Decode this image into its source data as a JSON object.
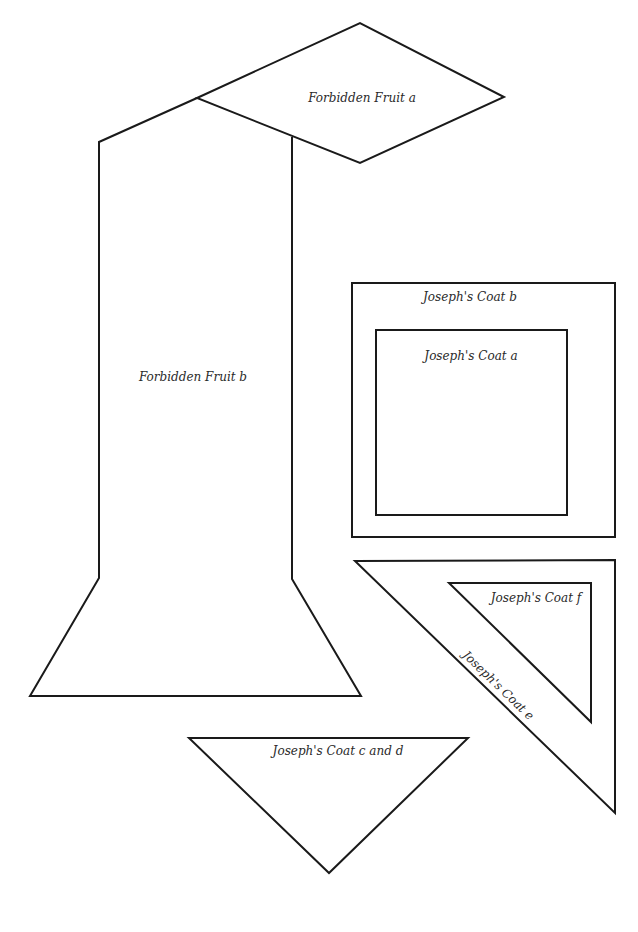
{
  "colors": {
    "line": "#1a1a1a",
    "text": "#2a2a2a",
    "background": "#ffffff"
  },
  "pieces": [
    {
      "id": "forbidden-fruit-a",
      "label": "Forbidden Fruit a",
      "shape": "diamond"
    },
    {
      "id": "forbidden-fruit-b",
      "label": "Forbidden Fruit b",
      "shape": "stem-with-base"
    },
    {
      "id": "josephs-coat-b",
      "label": "Joseph's Coat b",
      "shape": "square-frame-outer"
    },
    {
      "id": "josephs-coat-a",
      "label": "Joseph's Coat a",
      "shape": "square"
    },
    {
      "id": "josephs-coat-e",
      "label": "Joseph's Coat e",
      "shape": "right-triangle-outer"
    },
    {
      "id": "josephs-coat-f",
      "label": "Joseph's Coat f",
      "shape": "right-triangle-inner"
    },
    {
      "id": "josephs-coat-c-and-d",
      "label": "Joseph's Coat c and d",
      "shape": "inverted-triangle"
    }
  ]
}
